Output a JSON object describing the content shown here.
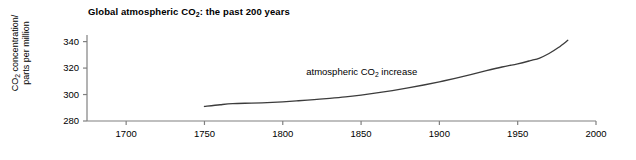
{
  "chart_data": {
    "type": "line",
    "title": "Global atmospheric CO2: the past 200 years",
    "title_parts": {
      "pre": "Global atmospheric CO",
      "sub": "2",
      "post": ": the past 200 years"
    },
    "xlabel": "date",
    "ylabel": "CO2 concentration/ parts per million",
    "ylabel_parts": {
      "line1_pre": "CO",
      "line1_sub": "2",
      "line1_post": " concentration/",
      "line2": "parts per million"
    },
    "xlim": [
      1675,
      2000
    ],
    "ylim": [
      280,
      345
    ],
    "xticks": [
      1700,
      1750,
      1800,
      1850,
      1900,
      1950,
      2000
    ],
    "xtick_labels": [
      "1700",
      "1750",
      "1800",
      "1850",
      "1900",
      "1950",
      "2000"
    ],
    "yticks": [
      280,
      300,
      320,
      340
    ],
    "ytick_labels": [
      "280",
      "300",
      "320",
      "340"
    ],
    "grid": false,
    "legend": "none",
    "line_color": "#3c3c3c",
    "axis_color": "#808080",
    "annotations": [
      {
        "text": "atmospheric CO2 increase",
        "parts": {
          "pre": "atmospheric CO",
          "sub": "2",
          "post": " increase"
        },
        "x": 1815,
        "y": 317
      }
    ],
    "series": [
      {
        "name": "atmospheric CO2 increase",
        "x": [
          1750,
          1760,
          1768,
          1780,
          1790,
          1800,
          1810,
          1820,
          1830,
          1840,
          1850,
          1860,
          1870,
          1880,
          1890,
          1900,
          1910,
          1920,
          1930,
          1940,
          1950,
          1958,
          1964,
          1970,
          1976,
          1982
        ],
        "values": [
          291.0,
          292.3,
          293.1,
          293.5,
          293.9,
          294.5,
          295.3,
          296.2,
          297.1,
          298.2,
          299.6,
          301.2,
          303.0,
          305.0,
          307.2,
          309.6,
          312.2,
          315.0,
          318.0,
          320.8,
          323.2,
          325.6,
          327.6,
          331.0,
          335.5,
          341.0
        ]
      }
    ]
  }
}
